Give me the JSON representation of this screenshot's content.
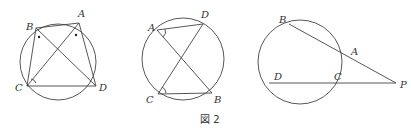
{
  "caption": "図 2",
  "figures": [
    {
      "id": "fig-left",
      "points": {
        "A": "A",
        "B": "B",
        "C": "C",
        "D": "D"
      },
      "description": "Cyclic quadrilateral ABDC with diagonals AC and BD; equal angle marks (dots) at B and A, arc mark at C"
    },
    {
      "id": "fig-middle",
      "points": {
        "A": "A",
        "B": "B",
        "C": "C",
        "D": "D"
      },
      "description": "Circle with chords AD, CB and crossing segments AB, CD; angle marks at A and C"
    },
    {
      "id": "fig-right",
      "points": {
        "A": "A",
        "B": "B",
        "C": "C",
        "D": "D",
        "P": "P"
      },
      "description": "Circle with secants PAB and PCD from external point P"
    }
  ]
}
